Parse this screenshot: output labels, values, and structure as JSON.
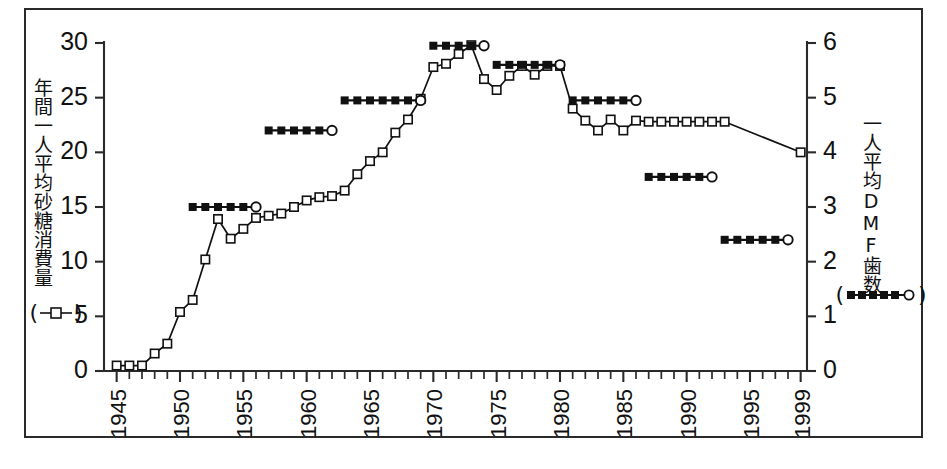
{
  "figure": {
    "left_axis_title": "年間一人平均砂糖消費量",
    "right_axis_title": "一人平均DMF歯数",
    "left_legend_open_paren": "(",
    "left_legend_close_paren": ")",
    "right_legend_open_paren": "(",
    "right_legend_close_paren": ")",
    "caption": ""
  },
  "chart_data": {
    "type": "line",
    "title": "",
    "xlabel": "",
    "ylabel": "年間一人平均砂糖消費量",
    "y2label": "一人平均DMF歯数",
    "grid": false,
    "legend_position": "axis-labels",
    "xlim": [
      1944,
      1999.5
    ],
    "ylim": [
      0,
      30
    ],
    "y2lim": [
      0,
      6
    ],
    "x_tick_labels": [
      "1945",
      "1950",
      "1955",
      "1960",
      "1965",
      "1970",
      "1975",
      "1980",
      "1985",
      "1990",
      "1995",
      "1999"
    ],
    "x_tick_values": [
      1945,
      1950,
      1955,
      1960,
      1965,
      1970,
      1975,
      1980,
      1985,
      1990,
      1995,
      1999
    ],
    "x_minor_tick_step": 1,
    "y_tick_labels": [
      "0",
      "5",
      "10",
      "15",
      "20",
      "25",
      "30"
    ],
    "y_tick_values": [
      0,
      5,
      10,
      15,
      20,
      25,
      30
    ],
    "y2_tick_labels": [
      "0",
      "1",
      "2",
      "3",
      "4",
      "5",
      "6"
    ],
    "y2_tick_values": [
      0,
      1,
      2,
      3,
      4,
      5,
      6
    ],
    "series": [
      {
        "name": "年間一人平均砂糖消費量",
        "axis": "left",
        "marker": "open-square",
        "line": "solid",
        "x": [
          1945,
          1946,
          1947,
          1948,
          1949,
          1950,
          1951,
          1952,
          1953,
          1954,
          1955,
          1956,
          1957,
          1958,
          1959,
          1960,
          1961,
          1962,
          1963,
          1964,
          1965,
          1966,
          1967,
          1968,
          1969,
          1970,
          1971,
          1972,
          1973,
          1974,
          1975,
          1976,
          1977,
          1978,
          1979,
          1980,
          1981,
          1982,
          1983,
          1984,
          1985,
          1986,
          1987,
          1988,
          1989,
          1990,
          1991,
          1992,
          1993,
          1999
        ],
        "y": [
          0.5,
          0.5,
          0.5,
          1.6,
          2.5,
          5.4,
          6.5,
          10.2,
          13.9,
          12.1,
          13.0,
          14.0,
          14.2,
          14.4,
          15.0,
          15.6,
          15.9,
          16.0,
          16.5,
          18.0,
          19.2,
          20.0,
          21.8,
          23.0,
          24.9,
          27.8,
          28.1,
          29.0,
          29.8,
          26.7,
          25.7,
          27.0,
          27.9,
          27.1,
          27.9,
          27.9,
          24.0,
          22.9,
          22.0,
          23.0,
          22.0,
          22.9,
          22.8,
          22.8,
          22.8,
          22.8,
          22.8,
          22.8,
          22.8,
          20.0
        ]
      },
      {
        "name": "一人平均DMF歯数",
        "axis": "right",
        "marker": "filled-square",
        "end_marker": "open-circle",
        "line": "solid",
        "segments": [
          {
            "x_start": 1951,
            "x_end": 1956,
            "value": 3.0
          },
          {
            "x_start": 1957,
            "x_end": 1962,
            "value": 4.4
          },
          {
            "x_start": 1963,
            "x_end": 1969,
            "value": 4.95
          },
          {
            "x_start": 1970,
            "x_end": 1974,
            "value": 5.95
          },
          {
            "x_start": 1975,
            "x_end": 1980,
            "value": 5.6
          },
          {
            "x_start": 1981,
            "x_end": 1986,
            "value": 4.95
          },
          {
            "x_start": 1987,
            "x_end": 1992,
            "value": 3.55
          },
          {
            "x_start": 1993,
            "x_end": 1998,
            "value": 2.4
          }
        ]
      }
    ]
  }
}
